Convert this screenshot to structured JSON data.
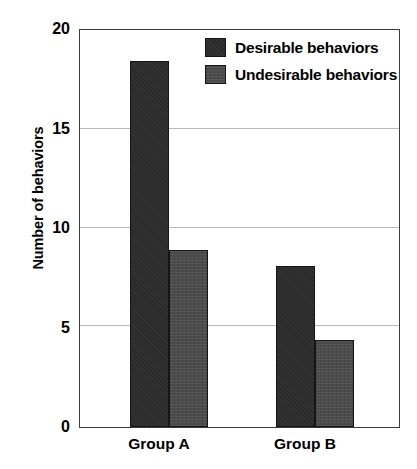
{
  "chart_data": {
    "type": "bar",
    "title": "",
    "subtitle": "",
    "xlabel": "",
    "ylabel": "Number of behaviors",
    "categories": [
      "Group A",
      "Group B"
    ],
    "series": [
      {
        "name": "Desirable behaviors",
        "values": [
          18.6,
          8.2
        ],
        "color": "#2b2b2b"
      },
      {
        "name": "Undesirable behaviors",
        "values": [
          9.0,
          4.4
        ],
        "color": "#4b4b4b"
      }
    ],
    "ylim": [
      0,
      20
    ],
    "yticks": [
      0,
      5,
      10,
      15,
      20
    ],
    "ytick_labels": [
      "0",
      "5",
      "10",
      "15",
      "20"
    ],
    "grid": true,
    "grid_axis": "y",
    "legend": true,
    "legend_position": "top-center-right",
    "annotations": [],
    "frame": true,
    "frame_color": "#3c3c3c",
    "background": "#ffffff"
  },
  "axis": {
    "y_title": "Number of behaviors",
    "tick_labels": [
      "20",
      "15",
      "10",
      "5",
      "0"
    ]
  },
  "legend": {
    "entries": [
      {
        "label": "Desirable behaviors",
        "swatch": "dark-solid-swatch"
      },
      {
        "label": "Undesirable behaviors",
        "swatch": "gray-hatched-swatch"
      }
    ]
  },
  "xaxis": {
    "labels": [
      "Group A",
      "Group B"
    ]
  }
}
